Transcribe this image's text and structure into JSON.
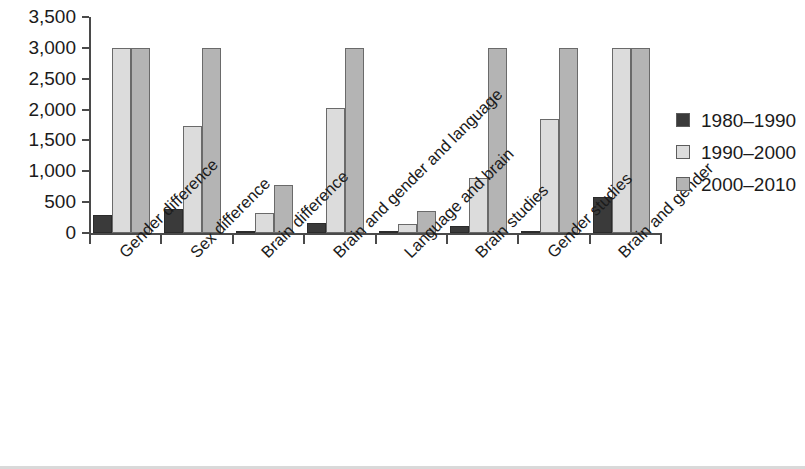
{
  "chart_data": {
    "type": "bar",
    "title": "",
    "subtitle": "",
    "xlabel": "",
    "ylabel": "",
    "ylim": [
      0,
      3500
    ],
    "ytick_step": 500,
    "ytick_labels": [
      "0",
      "500",
      "1,000",
      "1,500",
      "2,000",
      "2,500",
      "3,000",
      "3,500"
    ],
    "ytick_values": [
      0,
      500,
      1000,
      1500,
      2000,
      2500,
      3000,
      3500
    ],
    "grid": false,
    "legend_position": "right",
    "categories": [
      "Gender difference",
      "Sex difference",
      "Brain difference",
      "Brain and gender and language",
      "Language and brain",
      "Brain studies",
      "Gender studies",
      "Brain and gender"
    ],
    "series": [
      {
        "name": "1980–1990",
        "color": "#3a3a3a",
        "values": [
          300,
          390,
          30,
          170,
          25,
          120,
          30,
          590
        ]
      },
      {
        "name": "1990–2000",
        "color": "#dcdcdc",
        "values": [
          3000,
          1730,
          320,
          2030,
          140,
          890,
          1840,
          3000
        ]
      },
      {
        "name": "2000–2010",
        "color": "#b4b4b4",
        "values": [
          3000,
          3000,
          770,
          3000,
          350,
          3000,
          3000,
          2990
        ]
      }
    ]
  },
  "axis": {
    "line_color": "#4a4a4a"
  }
}
